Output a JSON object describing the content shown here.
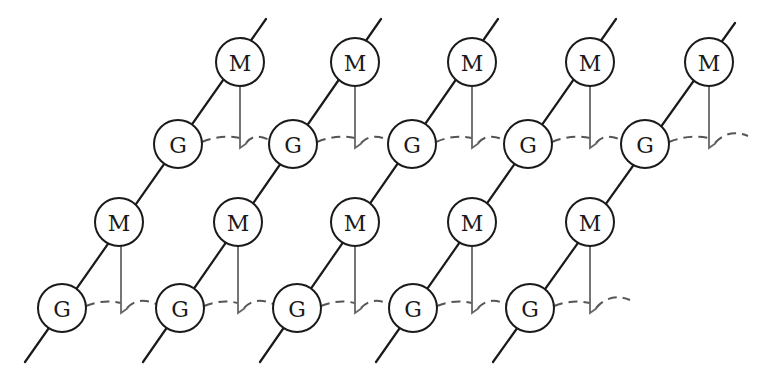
{
  "diagram": {
    "title": "",
    "node_radius": 24,
    "colors": {
      "line": "#1a1a1a",
      "link": "#666666",
      "dash": "#555555",
      "node_fill": "#ffffff"
    },
    "node_types": {
      "G": "G",
      "M": "M"
    },
    "chains": [
      {
        "id": "chain-1",
        "start": [
          25,
          362
        ],
        "end": [
          266,
          19
        ],
        "nodes": [
          {
            "label": "G",
            "x": 62,
            "y": 308
          },
          {
            "label": "M",
            "x": 119,
            "y": 222
          },
          {
            "label": "G",
            "x": 178,
            "y": 144
          },
          {
            "label": "M",
            "x": 240,
            "y": 62
          }
        ]
      },
      {
        "id": "chain-2",
        "start": [
          143,
          362
        ],
        "end": [
          381,
          19
        ],
        "nodes": [
          {
            "label": "G",
            "x": 180,
            "y": 308
          },
          {
            "label": "M",
            "x": 238,
            "y": 222
          },
          {
            "label": "G",
            "x": 293,
            "y": 144
          },
          {
            "label": "M",
            "x": 355,
            "y": 62
          }
        ]
      },
      {
        "id": "chain-3",
        "start": [
          260,
          362
        ],
        "end": [
          498,
          19
        ],
        "nodes": [
          {
            "label": "G",
            "x": 297,
            "y": 308
          },
          {
            "label": "M",
            "x": 355,
            "y": 222
          },
          {
            "label": "G",
            "x": 412,
            "y": 144
          },
          {
            "label": "M",
            "x": 472,
            "y": 62
          }
        ]
      },
      {
        "id": "chain-4",
        "start": [
          376,
          362
        ],
        "end": [
          616,
          19
        ],
        "nodes": [
          {
            "label": "G",
            "x": 413,
            "y": 308
          },
          {
            "label": "M",
            "x": 472,
            "y": 222
          },
          {
            "label": "G",
            "x": 528,
            "y": 144
          },
          {
            "label": "M",
            "x": 590,
            "y": 62
          }
        ]
      },
      {
        "id": "chain-5",
        "start": [
          493,
          362
        ],
        "end": [
          735,
          23
        ],
        "nodes": [
          {
            "label": "G",
            "x": 530,
            "y": 308
          },
          {
            "label": "M",
            "x": 590,
            "y": 222
          },
          {
            "label": "G",
            "x": 645,
            "y": 144
          },
          {
            "label": "M",
            "x": 709,
            "y": 62
          }
        ]
      }
    ],
    "rows": [
      {
        "id": "top-row",
        "dash_start": [
          178,
          144
        ],
        "dash_end": [
          748,
          136
        ],
        "dash_y": 136,
        "m_to_g_links": [
          {
            "x": 240,
            "y_top": 86,
            "y_bottom": 148
          },
          {
            "x": 355,
            "y_top": 86,
            "y_bottom": 148
          },
          {
            "x": 472,
            "y_top": 86,
            "y_bottom": 148
          },
          {
            "x": 590,
            "y_top": 86,
            "y_bottom": 148
          },
          {
            "x": 709,
            "y_top": 86,
            "y_bottom": 148
          }
        ]
      },
      {
        "id": "bottom-row",
        "dash_start": [
          62,
          308
        ],
        "dash_end": [
          630,
          300
        ],
        "dash_y": 300,
        "m_to_g_links": [
          {
            "x": 121,
            "y_top": 246,
            "y_bottom": 313
          },
          {
            "x": 238,
            "y_top": 246,
            "y_bottom": 313
          },
          {
            "x": 355,
            "y_top": 246,
            "y_bottom": 313
          },
          {
            "x": 472,
            "y_top": 246,
            "y_bottom": 313
          },
          {
            "x": 590,
            "y_top": 246,
            "y_bottom": 313
          }
        ]
      }
    ]
  }
}
